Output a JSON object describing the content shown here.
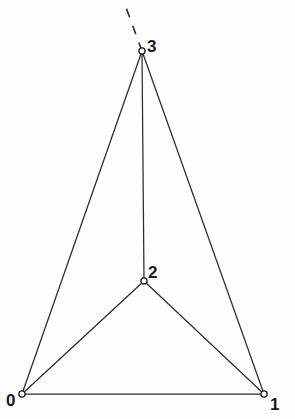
{
  "figure": {
    "width": 295,
    "height": 419,
    "background_color": "#fefefe",
    "line_color": "#2b2b2b",
    "label_color": "#1a1a1a"
  },
  "chart_data": {
    "type": "diagram",
    "diagram_kind": "node-link-graph",
    "title": "",
    "nodes": [
      {
        "id": "0",
        "label": "0",
        "x": 22,
        "y": 394,
        "label_x": 6,
        "label_y": 392
      },
      {
        "id": "1",
        "label": "1",
        "x": 264,
        "y": 394,
        "label_x": 270,
        "label_y": 396
      },
      {
        "id": "2",
        "label": "2",
        "x": 144,
        "y": 281,
        "label_x": 148,
        "label_y": 264
      },
      {
        "id": "3",
        "label": "3",
        "x": 142,
        "y": 51,
        "label_x": 147,
        "label_y": 38
      }
    ],
    "edges": [
      {
        "from": "0",
        "to": "1",
        "style": "solid"
      },
      {
        "from": "0",
        "to": "2",
        "style": "solid"
      },
      {
        "from": "1",
        "to": "2",
        "style": "solid"
      },
      {
        "from": "0",
        "to": "3",
        "style": "solid"
      },
      {
        "from": "1",
        "to": "3",
        "style": "solid"
      },
      {
        "from": "2",
        "to": "3",
        "style": "solid"
      }
    ],
    "rays": [
      {
        "from": "3",
        "to_x": 124,
        "to_y": 2,
        "style": "dashed"
      }
    ],
    "node_count": 4,
    "edge_count": 6
  }
}
